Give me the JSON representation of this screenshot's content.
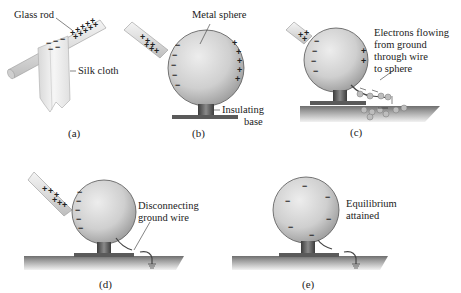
{
  "panels": {
    "a": {
      "caption": "(a)",
      "labels": {
        "rod": "Glass rod",
        "cloth": "Silk cloth"
      }
    },
    "b": {
      "caption": "(b)",
      "labels": {
        "sphere": "Metal sphere",
        "base_line1": "Insulating",
        "base_line2": "base"
      }
    },
    "c": {
      "caption": "(c)",
      "labels": {
        "line1": "Electrons flowing",
        "line2": "from ground",
        "line3": "through wire",
        "line4": "to sphere"
      }
    },
    "d": {
      "caption": "(d)",
      "labels": {
        "line1": "Disconnecting",
        "line2": "ground wire"
      }
    },
    "e": {
      "caption": "(e)",
      "labels": {
        "line1": "Equilibrium",
        "line2": "attained"
      }
    }
  },
  "symbols": {
    "plus": "+",
    "minus": "−"
  },
  "colors": {
    "sphere_light": "#e6e6e6",
    "sphere_dark": "#9a9a9a",
    "rod": "#e8e8e8",
    "ground": "#8a8a8a",
    "text": "#222222"
  }
}
